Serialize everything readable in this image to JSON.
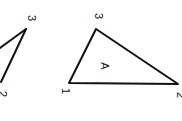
{
  "diagram": {
    "line_color": "#111111",
    "background": "#ffffff",
    "left_triangle": {
      "labels": {
        "top_vertex": "3",
        "bottom_vertex": "2"
      }
    },
    "right_triangle": {
      "region_label": "A",
      "labels": {
        "left_vertex": "1",
        "top_vertex": "3",
        "right_vertex": "2"
      }
    }
  }
}
